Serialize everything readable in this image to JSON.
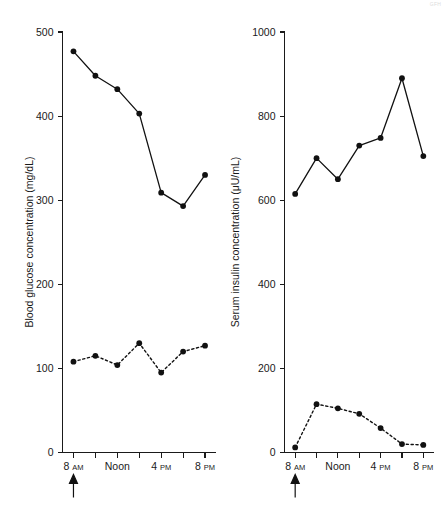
{
  "figure": {
    "watermark": "GFH",
    "panels": [
      "left",
      "right"
    ]
  },
  "chart_data": [
    {
      "id": "blood-glucose",
      "type": "line",
      "title": "",
      "xlabel": "",
      "ylabel": "Blood glucose concentration (mg/dL)",
      "x": [
        8,
        10,
        12,
        14,
        16,
        18,
        20
      ],
      "xtick_labels": [
        "8 AM",
        "",
        "Noon",
        "",
        "4 PM",
        "",
        "8 PM"
      ],
      "xtick_values": [
        8,
        10,
        12,
        14,
        16,
        18,
        20
      ],
      "xlim": [
        7,
        21
      ],
      "ylim": [
        0,
        500
      ],
      "ytick_values": [
        0,
        100,
        200,
        300,
        400,
        500
      ],
      "ytick_labels": [
        "0",
        "100",
        "200",
        "300",
        "400",
        "500"
      ],
      "grid": false,
      "legend": "none",
      "annotations": [
        {
          "name": "meal-arrow",
          "at_x": 8,
          "symbol": "up-arrow"
        }
      ],
      "series": [
        {
          "name": "untreated",
          "style": "solid",
          "marker": "filled-circle",
          "values": [
            477,
            448,
            432,
            403,
            309,
            293,
            330
          ]
        },
        {
          "name": "treated",
          "style": "dashed",
          "marker": "filled-circle",
          "values": [
            108,
            115,
            104,
            130,
            95,
            120,
            127
          ]
        }
      ]
    },
    {
      "id": "serum-insulin",
      "type": "line",
      "title": "",
      "xlabel": "",
      "ylabel": "Serum insulin concentration (μU/mL)",
      "x": [
        8,
        10,
        12,
        14,
        16,
        18,
        20
      ],
      "xtick_labels": [
        "8 AM",
        "",
        "Noon",
        "",
        "4 PM",
        "",
        "8 PM"
      ],
      "xtick_values": [
        8,
        10,
        12,
        14,
        16,
        18,
        20
      ],
      "xlim": [
        7,
        21
      ],
      "ylim": [
        0,
        1000
      ],
      "ytick_values": [
        0,
        200,
        400,
        600,
        800,
        1000
      ],
      "ytick_labels": [
        "0",
        "200",
        "400",
        "600",
        "800",
        "1000"
      ],
      "grid": false,
      "legend": "none",
      "annotations": [
        {
          "name": "meal-arrow",
          "at_x": 8,
          "symbol": "up-arrow"
        }
      ],
      "series": [
        {
          "name": "untreated",
          "style": "solid",
          "marker": "filled-circle",
          "values": [
            615,
            700,
            650,
            730,
            748,
            890,
            705
          ]
        },
        {
          "name": "treated",
          "style": "dashed",
          "marker": "filled-circle",
          "values": [
            12,
            115,
            105,
            92,
            58,
            20,
            18
          ]
        }
      ]
    }
  ]
}
